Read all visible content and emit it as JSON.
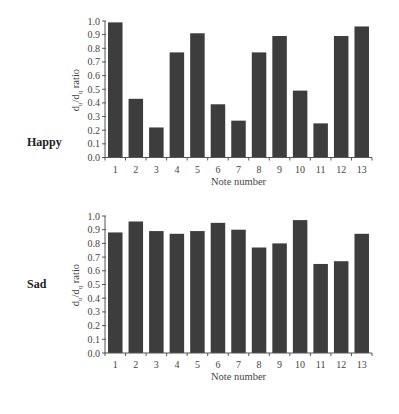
{
  "chart_data": [
    {
      "type": "bar",
      "title": "Happy",
      "xlabel": "Note number",
      "ylabel": "du/dq ratio",
      "ylabel_parts": {
        "main1": "d",
        "sub1": "u",
        "sep": "/d",
        "sub2": "q",
        "rest": " ratio"
      },
      "categories": [
        "1",
        "2",
        "3",
        "4",
        "5",
        "6",
        "7",
        "8",
        "9",
        "10",
        "11",
        "12",
        "13"
      ],
      "values": [
        0.99,
        0.43,
        0.22,
        0.77,
        0.91,
        0.39,
        0.27,
        0.77,
        0.89,
        0.49,
        0.25,
        0.89,
        0.96
      ],
      "yticks": [
        "0.0",
        "0.1",
        "0.2",
        "0.3",
        "0.4",
        "0.5",
        "0.6",
        "0.7",
        "0.8",
        "0.9",
        "1.0"
      ],
      "ylim": [
        0,
        1.0
      ],
      "grid": false,
      "legend": null
    },
    {
      "type": "bar",
      "title": "Sad",
      "xlabel": "Note number",
      "ylabel": "du/dq ratio",
      "ylabel_parts": {
        "main1": "d",
        "sub1": "u",
        "sep": "/d",
        "sub2": "q",
        "rest": " ratio"
      },
      "categories": [
        "1",
        "2",
        "3",
        "4",
        "5",
        "6",
        "7",
        "8",
        "9",
        "10",
        "11",
        "12",
        "13"
      ],
      "values": [
        0.88,
        0.96,
        0.89,
        0.87,
        0.89,
        0.95,
        0.9,
        0.77,
        0.8,
        0.97,
        0.65,
        0.67,
        0.87
      ],
      "yticks": [
        "0.0",
        "0.1",
        "0.2",
        "0.3",
        "0.4",
        "0.5",
        "0.6",
        "0.7",
        "0.8",
        "0.9",
        "1.0"
      ],
      "ylim": [
        0,
        1.0
      ],
      "grid": false,
      "legend": null
    }
  ],
  "style": {
    "bar_color": "#3d3d3d",
    "axis_color": "#555555"
  }
}
